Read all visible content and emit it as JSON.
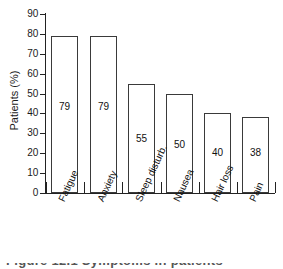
{
  "chart_data": {
    "type": "bar",
    "title": "",
    "xlabel": "",
    "ylabel": "Patients (%)",
    "categories": [
      "Fatigue",
      "Anxiety",
      "Sleep disturb.",
      "Nausea",
      "Hair loss",
      "Pain"
    ],
    "values": [
      79,
      79,
      55,
      50,
      40,
      38
    ],
    "value_labels": [
      "79",
      "79",
      "55",
      "50",
      "40",
      "38"
    ],
    "ylim": [
      0,
      90
    ],
    "ytick_values": [
      0,
      10,
      20,
      30,
      40,
      50,
      60,
      70,
      80,
      90
    ],
    "ytick_labels": [
      "0",
      "10",
      "20",
      "30",
      "40",
      "50",
      "60",
      "70",
      "80",
      "90"
    ],
    "grid": false,
    "legend": "none",
    "bar_fill_color": "#ffffff",
    "bar_edge_color": "#3a3a3a",
    "axis_color": "#222222",
    "text_color": "#111111",
    "background_color": "#ffffff",
    "category_label_rotation_deg": -65,
    "value_label_positions_pct": [
      43,
      43,
      27,
      24,
      20,
      20
    ]
  },
  "caption": {
    "text": "Figure 12.1  Symptoms in patients",
    "note": "cropped"
  }
}
